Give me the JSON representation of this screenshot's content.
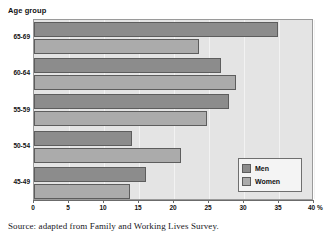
{
  "axis_title": "Age group",
  "caption": "Source: adapted from Family and Working Lives Survey.",
  "x_unit": "%",
  "legend": {
    "men_label": "Men",
    "women_label": "Women"
  },
  "colors": {
    "men": "#8c8c8c",
    "women": "#ababab",
    "plot_background": "#e4e4e4",
    "bar_border": "#5d5d5d"
  },
  "chart_data": {
    "type": "bar",
    "orientation": "horizontal",
    "title": "Age group",
    "xlabel": "%",
    "ylabel": "Age group",
    "xlim": [
      0,
      40
    ],
    "xticks": [
      0,
      5,
      10,
      15,
      20,
      25,
      30,
      35,
      40
    ],
    "xtick_labels": [
      "0",
      "5",
      "10",
      "15",
      "20",
      "25",
      "30",
      "35",
      "40"
    ],
    "grid": true,
    "legend_position": "lower right",
    "categories": [
      "65-69",
      "60-64",
      "55-59",
      "50-54",
      "45-49"
    ],
    "series": [
      {
        "name": "Men",
        "values": [
          34.9,
          26.7,
          27.9,
          14.0,
          16.0
        ]
      },
      {
        "name": "Women",
        "values": [
          23.6,
          28.8,
          24.7,
          21.0,
          13.7
        ]
      }
    ],
    "annotations": [
      "Source: adapted from Family and Working Lives Survey."
    ]
  }
}
